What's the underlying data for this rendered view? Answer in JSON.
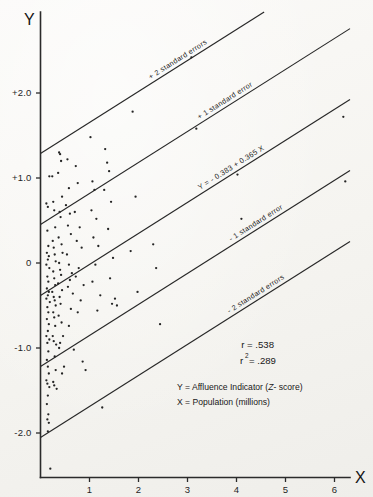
{
  "figure": {
    "background_color": "#f7f6f3",
    "ink_color": "#242424"
  },
  "axes": {
    "y_title": "Y",
    "x_title": "X",
    "y_ticks": [
      "+2.0",
      "+1.0",
      "0",
      "-1.0",
      "-2.0"
    ],
    "y_tick_values": [
      2.0,
      1.0,
      0,
      -1.0,
      -2.0
    ],
    "x_ticks": [
      "1",
      "2",
      "3",
      "4",
      "5",
      "6"
    ],
    "x_tick_values": [
      1,
      2,
      3,
      4,
      5,
      6
    ]
  },
  "annotations": {
    "plus_two_se": "+ 2 standard errors",
    "plus_one_se": "+ 1 standard error",
    "regression_equation": "Y = - 0.383 + 0.365 X",
    "minus_one_se": "- 1 standard error",
    "minus_two_se": "- 2 standard errors"
  },
  "statistics": {
    "r_label": "r = .538",
    "r_squared_base": "r",
    "r_squared_exponent": "2",
    "r_squared_value": "= .289",
    "r": 0.538,
    "r_squared": 0.289
  },
  "legend": {
    "y_definition_prefix": "Y = Affluence Indicator (",
    "y_definition_italic": "Z",
    "y_definition_suffix": "- score)",
    "x_definition": "X = Population (millions)"
  },
  "chart_data": {
    "type": "scatter",
    "title": "",
    "xlabel": "X",
    "ylabel": "Y",
    "xlim": [
      0,
      6.8
    ],
    "ylim": [
      -2.6,
      2.75
    ],
    "grid": false,
    "legend_position": "none",
    "x_ticks": [
      1,
      2,
      3,
      4,
      5,
      6
    ],
    "y_ticks": [
      -2.0,
      -1.0,
      0,
      1.0,
      2.0
    ],
    "regression": {
      "intercept": -0.383,
      "slope": 0.365,
      "equation": "Y = - 0.383 + 0.365 X",
      "r": 0.538,
      "r_squared": 0.289,
      "standard_error": 0.835,
      "bands": [
        {
          "name": "+ 2 standard errors",
          "offset": 1.67
        },
        {
          "name": "+ 1 standard error",
          "offset": 0.835
        },
        {
          "name": "regression",
          "offset": 0
        },
        {
          "name": "- 1 standard error",
          "offset": -0.835
        },
        {
          "name": "- 2 standard errors",
          "offset": -1.67
        }
      ]
    },
    "points": [
      [
        0.12,
        0.7
      ],
      [
        0.15,
        0.66
      ],
      [
        0.18,
        1.02
      ],
      [
        0.14,
        0.38
      ],
      [
        0.16,
        0.2
      ],
      [
        0.13,
        0.12
      ],
      [
        0.17,
        0.08
      ],
      [
        0.15,
        0.04
      ],
      [
        0.12,
        -0.02
      ],
      [
        0.18,
        -0.06
      ],
      [
        0.14,
        -0.16
      ],
      [
        0.16,
        -0.22
      ],
      [
        0.13,
        -0.3
      ],
      [
        0.17,
        -0.34
      ],
      [
        0.15,
        -0.38
      ],
      [
        0.12,
        -0.42
      ],
      [
        0.19,
        -0.46
      ],
      [
        0.14,
        -0.52
      ],
      [
        0.16,
        -0.58
      ],
      [
        0.13,
        -0.66
      ],
      [
        0.17,
        -0.72
      ],
      [
        0.15,
        -0.8
      ],
      [
        0.12,
        -0.86
      ],
      [
        0.18,
        -0.9
      ],
      [
        0.14,
        -0.94
      ],
      [
        0.16,
        -1.04
      ],
      [
        0.13,
        -1.14
      ],
      [
        0.15,
        -1.22
      ],
      [
        0.17,
        -1.3
      ],
      [
        0.12,
        -1.38
      ],
      [
        0.14,
        -1.42
      ],
      [
        0.18,
        -1.46
      ],
      [
        0.15,
        -1.56
      ],
      [
        0.13,
        -1.66
      ],
      [
        0.16,
        -1.78
      ],
      [
        0.14,
        -1.84
      ],
      [
        0.17,
        -1.88
      ],
      [
        0.15,
        -1.98
      ],
      [
        0.2,
        -2.42
      ],
      [
        0.24,
        1.02
      ],
      [
        0.26,
        0.72
      ],
      [
        0.28,
        0.62
      ],
      [
        0.3,
        0.42
      ],
      [
        0.25,
        0.26
      ],
      [
        0.27,
        0.18
      ],
      [
        0.29,
        0.1
      ],
      [
        0.31,
        0.02
      ],
      [
        0.26,
        -0.1
      ],
      [
        0.28,
        -0.18
      ],
      [
        0.3,
        -0.26
      ],
      [
        0.24,
        -0.34
      ],
      [
        0.27,
        -0.4
      ],
      [
        0.29,
        -0.44
      ],
      [
        0.31,
        -0.5
      ],
      [
        0.26,
        -0.58
      ],
      [
        0.28,
        -0.64
      ],
      [
        0.3,
        -0.74
      ],
      [
        0.25,
        -0.86
      ],
      [
        0.27,
        -0.92
      ],
      [
        0.32,
        -0.96
      ],
      [
        0.29,
        -1.1
      ],
      [
        0.31,
        -1.26
      ],
      [
        0.26,
        -1.4
      ],
      [
        0.28,
        -1.44
      ],
      [
        0.33,
        -1.48
      ],
      [
        0.38,
        1.3
      ],
      [
        0.4,
        1.28
      ],
      [
        0.42,
        1.2
      ],
      [
        0.36,
        1.06
      ],
      [
        0.44,
        0.78
      ],
      [
        0.39,
        0.6
      ],
      [
        0.41,
        0.54
      ],
      [
        0.37,
        0.3
      ],
      [
        0.43,
        0.22
      ],
      [
        0.45,
        0.12
      ],
      [
        0.38,
        0.0
      ],
      [
        0.4,
        -0.08
      ],
      [
        0.42,
        -0.14
      ],
      [
        0.36,
        -0.24
      ],
      [
        0.44,
        -0.32
      ],
      [
        0.39,
        -0.4
      ],
      [
        0.41,
        -0.48
      ],
      [
        0.37,
        -0.62
      ],
      [
        0.43,
        -0.7
      ],
      [
        0.46,
        -0.86
      ],
      [
        0.4,
        -0.94
      ],
      [
        0.38,
        -1.0
      ],
      [
        0.48,
        -1.22
      ],
      [
        0.44,
        -1.3
      ],
      [
        0.55,
        1.22
      ],
      [
        0.58,
        0.88
      ],
      [
        0.52,
        0.68
      ],
      [
        0.6,
        0.58
      ],
      [
        0.56,
        0.44
      ],
      [
        0.62,
        0.34
      ],
      [
        0.54,
        0.1
      ],
      [
        0.58,
        -0.02
      ],
      [
        0.64,
        -0.12
      ],
      [
        0.6,
        -0.2
      ],
      [
        0.56,
        -0.28
      ],
      [
        0.66,
        -0.36
      ],
      [
        0.62,
        -0.54
      ],
      [
        0.58,
        -0.74
      ],
      [
        0.68,
        -1.02
      ],
      [
        0.72,
        1.14
      ],
      [
        0.76,
        0.94
      ],
      [
        0.7,
        0.6
      ],
      [
        0.8,
        0.42
      ],
      [
        0.74,
        0.26
      ],
      [
        0.84,
        0.18
      ],
      [
        0.78,
        -0.06
      ],
      [
        0.72,
        -0.16
      ],
      [
        0.88,
        -0.26
      ],
      [
        0.82,
        -0.44
      ],
      [
        0.76,
        -0.58
      ],
      [
        0.86,
        -1.16
      ],
      [
        0.92,
        -1.26
      ],
      [
        1.02,
        1.48
      ],
      [
        1.06,
        0.96
      ],
      [
        1.1,
        0.86
      ],
      [
        1.04,
        0.62
      ],
      [
        1.14,
        0.52
      ],
      [
        1.08,
        0.3
      ],
      [
        1.18,
        0.2
      ],
      [
        1.12,
        -0.02
      ],
      [
        1.06,
        -0.22
      ],
      [
        1.22,
        -0.38
      ],
      [
        1.16,
        -0.56
      ],
      [
        1.26,
        -1.7
      ],
      [
        1.32,
        1.34
      ],
      [
        1.36,
        1.18
      ],
      [
        1.4,
        1.08
      ],
      [
        1.3,
        0.86
      ],
      [
        1.44,
        0.72
      ],
      [
        1.38,
        0.4
      ],
      [
        1.48,
        0.06
      ],
      [
        1.42,
        -0.18
      ],
      [
        1.52,
        -0.42
      ],
      [
        1.46,
        -0.48
      ],
      [
        1.56,
        -0.5
      ],
      [
        1.88,
        1.78
      ],
      [
        1.94,
        0.78
      ],
      [
        1.84,
        0.14
      ],
      [
        1.98,
        -0.34
      ],
      [
        2.3,
        0.22
      ],
      [
        2.36,
        -0.06
      ],
      [
        2.44,
        -0.72
      ],
      [
        3.08,
        2.42
      ],
      [
        3.18,
        1.58
      ],
      [
        4.02,
        1.04
      ],
      [
        4.1,
        0.52
      ],
      [
        6.18,
        1.72
      ],
      [
        6.22,
        0.96
      ]
    ]
  }
}
